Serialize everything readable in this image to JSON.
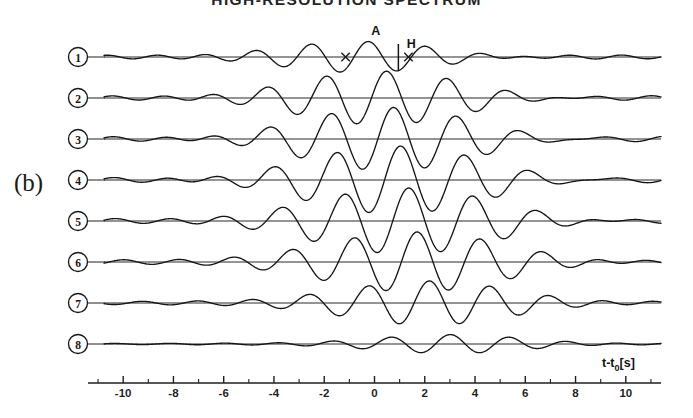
{
  "figure": {
    "title": "HIGH-RESOLUTION SPECTRUM",
    "panel_label": "(b)",
    "background_color": "#ffffff",
    "trace_color": "#161616"
  },
  "axis": {
    "label_main": "t-t",
    "label_sub": "0",
    "label_unit": "[s]",
    "label_full": "t-t0[s]",
    "min": -11.4,
    "max": 11.4,
    "major_tick_values": [
      -10,
      -8,
      -6,
      -4,
      -2,
      0,
      2,
      4,
      6,
      8,
      10
    ],
    "major_tick_labels": [
      "-10",
      "-8",
      "-6",
      "-4",
      "-2",
      "0",
      "2",
      "4",
      "6",
      "8",
      "10"
    ],
    "minor_tick_values": [
      -11,
      -9,
      -7,
      -5,
      -3,
      -1,
      1,
      3,
      5,
      7,
      9,
      11
    ],
    "pixel_left": 88,
    "pixel_right": 661,
    "pixel_y": 383
  },
  "annotations": [
    {
      "name": "amplitude-marker",
      "label": "A",
      "trace_index": 0,
      "t": 0.05,
      "description": "peak amplitude label on trace 1"
    },
    {
      "name": "half-period-marker",
      "label": "H",
      "trace_index": 0,
      "t": 0.95,
      "description": "half-period tick label on trace 1"
    }
  ],
  "chart_data": {
    "type": "line",
    "title": "HIGH-RESOLUTION SPECTRUM",
    "xlabel": "t-t0[s]",
    "ylabel": "",
    "xlim": [
      -11.4,
      11.4
    ],
    "grid": false,
    "legend": "none",
    "series": [
      {
        "name": "1",
        "label": "1",
        "baseline_y": 57,
        "center": -0.2,
        "envelope_width": 4.6,
        "period": 2.35,
        "amplitude": 0.42,
        "phase": 0.0,
        "tail_amplitude": 0.11,
        "tail_period": 2.05
      },
      {
        "name": "2",
        "label": "2",
        "baseline_y": 98,
        "center": 0.55,
        "envelope_width": 4.9,
        "period": 2.45,
        "amplitude": 0.78,
        "phase": 0.1,
        "tail_amplitude": 0.13,
        "tail_period": 2.15
      },
      {
        "name": "3",
        "label": "3",
        "baseline_y": 139,
        "center": 0.85,
        "envelope_width": 5.1,
        "period": 2.55,
        "amplitude": 0.93,
        "phase": 0.15,
        "tail_amplitude": 0.14,
        "tail_period": 2.2
      },
      {
        "name": "4",
        "label": "4",
        "baseline_y": 180,
        "center": 1.15,
        "envelope_width": 5.3,
        "period": 2.6,
        "amplitude": 1.0,
        "phase": 0.2,
        "tail_amplitude": 0.15,
        "tail_period": 2.25
      },
      {
        "name": "5",
        "label": "5",
        "baseline_y": 221,
        "center": 1.5,
        "envelope_width": 5.3,
        "period": 2.6,
        "amplitude": 0.97,
        "phase": 0.25,
        "tail_amplitude": 0.15,
        "tail_period": 2.3
      },
      {
        "name": "6",
        "label": "6",
        "baseline_y": 262,
        "center": 1.85,
        "envelope_width": 5.1,
        "period": 2.55,
        "amplitude": 0.88,
        "phase": 0.3,
        "tail_amplitude": 0.14,
        "tail_period": 2.3
      },
      {
        "name": "7",
        "label": "7",
        "baseline_y": 303,
        "center": 2.35,
        "envelope_width": 4.6,
        "period": 2.45,
        "amplitude": 0.64,
        "phase": 0.35,
        "tail_amplitude": 0.11,
        "tail_period": 2.25
      },
      {
        "name": "8",
        "label": "8",
        "baseline_y": 344,
        "center": 3.2,
        "envelope_width": 4.0,
        "period": 2.4,
        "amplitude": 0.27,
        "phase": 0.4,
        "tail_amplitude": 0.05,
        "tail_period": 2.2
      }
    ]
  }
}
